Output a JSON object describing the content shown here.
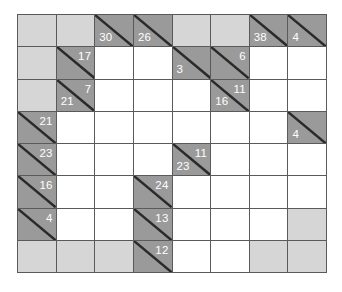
{
  "puzzle": {
    "type": "kakuro",
    "rows": 8,
    "cols": 8,
    "colors": {
      "grid_line": "#5a5a5a",
      "blank": "#d6d6d6",
      "clue": "#9a9a9a",
      "white": "#ffffff",
      "clue_text": "#ffffff"
    },
    "grid": [
      [
        {
          "t": "blank"
        },
        {
          "t": "blank"
        },
        {
          "t": "clue",
          "down": "30"
        },
        {
          "t": "clue",
          "down": "26"
        },
        {
          "t": "blank"
        },
        {
          "t": "blank"
        },
        {
          "t": "clue",
          "down": "38"
        },
        {
          "t": "clue",
          "down": "4"
        }
      ],
      [
        {
          "t": "blank"
        },
        {
          "t": "clue",
          "across": "17"
        },
        {
          "t": "white"
        },
        {
          "t": "white"
        },
        {
          "t": "clue",
          "down": "3"
        },
        {
          "t": "clue",
          "across": "6"
        },
        {
          "t": "white"
        },
        {
          "t": "white"
        }
      ],
      [
        {
          "t": "blank"
        },
        {
          "t": "clue",
          "across": "7",
          "down": "21"
        },
        {
          "t": "white"
        },
        {
          "t": "white"
        },
        {
          "t": "white"
        },
        {
          "t": "clue",
          "across": "11",
          "down": "16"
        },
        {
          "t": "white"
        },
        {
          "t": "white"
        }
      ],
      [
        {
          "t": "clue",
          "across": "21"
        },
        {
          "t": "white"
        },
        {
          "t": "white"
        },
        {
          "t": "white"
        },
        {
          "t": "white"
        },
        {
          "t": "white"
        },
        {
          "t": "white"
        },
        {
          "t": "clue",
          "down": "4"
        }
      ],
      [
        {
          "t": "clue",
          "across": "23"
        },
        {
          "t": "white"
        },
        {
          "t": "white"
        },
        {
          "t": "white"
        },
        {
          "t": "clue",
          "across": "11",
          "down": "23"
        },
        {
          "t": "white"
        },
        {
          "t": "white"
        },
        {
          "t": "white"
        }
      ],
      [
        {
          "t": "clue",
          "across": "16"
        },
        {
          "t": "white"
        },
        {
          "t": "white"
        },
        {
          "t": "clue",
          "across": "24"
        },
        {
          "t": "white"
        },
        {
          "t": "white"
        },
        {
          "t": "white"
        },
        {
          "t": "white"
        }
      ],
      [
        {
          "t": "clue",
          "across": "4"
        },
        {
          "t": "white"
        },
        {
          "t": "white"
        },
        {
          "t": "clue",
          "across": "13"
        },
        {
          "t": "white"
        },
        {
          "t": "white"
        },
        {
          "t": "white"
        },
        {
          "t": "blank"
        }
      ],
      [
        {
          "t": "blank"
        },
        {
          "t": "blank"
        },
        {
          "t": "blank"
        },
        {
          "t": "clue",
          "across": "12"
        },
        {
          "t": "white"
        },
        {
          "t": "white"
        },
        {
          "t": "blank"
        },
        {
          "t": "blank"
        }
      ]
    ]
  }
}
